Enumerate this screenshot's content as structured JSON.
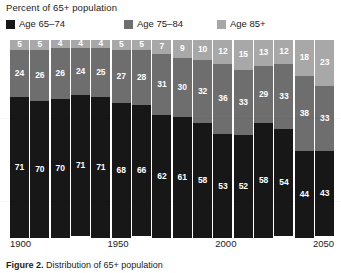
{
  "chart": {
    "title": "Percent of 65+ population",
    "caption_prefix": "Figure 2.",
    "caption_text": "  Distribution of 65+ population"
  },
  "legend": {
    "items": [
      {
        "label": "Age 65–74",
        "color": "#171717"
      },
      {
        "label": "Age 75–84",
        "color": "#6e6e6e"
      },
      {
        "label": "Age 85+",
        "color": "#a8a8a8"
      }
    ]
  },
  "axis": {
    "ticks": [
      {
        "label": "1900",
        "pos_pct": 0.0
      },
      {
        "label": "1950",
        "pos_pct": 33.3
      },
      {
        "label": "2000",
        "pos_pct": 66.6
      },
      {
        "label": "2050",
        "pos_pct": 100.0
      }
    ]
  },
  "chart_data": {
    "type": "bar",
    "subtype": "stacked-100-percent",
    "title": "Percent of 65+ population",
    "xlabel": "",
    "ylabel": "Percent of 65+ population",
    "ylim": [
      0,
      100
    ],
    "grid": false,
    "legend_position": "top",
    "categories": [
      "1900",
      "1910",
      "1920",
      "1930",
      "1940",
      "1950",
      "1960",
      "1970",
      "1980",
      "1990",
      "2000",
      "2010",
      "2020",
      "2030",
      "2040",
      "2050"
    ],
    "tick_labels_shown": [
      "1900",
      "1950",
      "2000",
      "2050"
    ],
    "series": [
      {
        "name": "Age 65–74",
        "color": "#171717",
        "values": [
          71,
          70,
          70,
          71,
          71,
          68,
          66,
          62,
          61,
          58,
          53,
          52,
          58,
          54,
          44,
          43
        ]
      },
      {
        "name": "Age 75–84",
        "color": "#6e6e6e",
        "values": [
          24,
          26,
          26,
          24,
          25,
          27,
          28,
          31,
          30,
          32,
          36,
          33,
          29,
          33,
          38,
          33
        ]
      },
      {
        "name": "Age 85+",
        "color": "#a8a8a8",
        "values": [
          5,
          5,
          4,
          4,
          4,
          5,
          5,
          7,
          9,
          10,
          12,
          15,
          13,
          12,
          18,
          23
        ]
      }
    ]
  }
}
